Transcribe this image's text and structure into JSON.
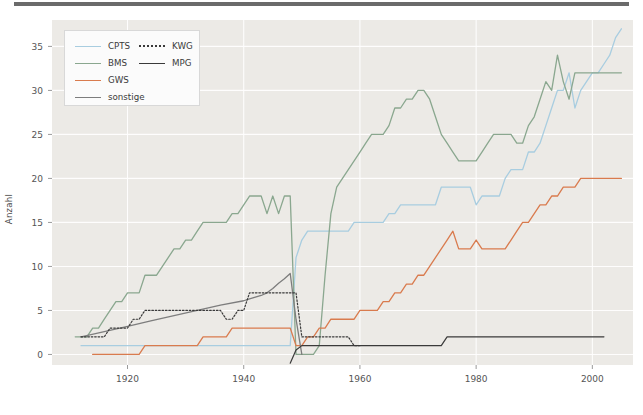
{
  "figure": {
    "background": "#ffffff",
    "plot_background": "#eceae6",
    "grid_color": "#ffffff",
    "top_rule_color": "#6b6b6b"
  },
  "chart_data": {
    "type": "line",
    "title": "",
    "xlabel": "",
    "ylabel": "Anzahl",
    "xlim": [
      1907,
      2007
    ],
    "ylim": [
      -1.2,
      38
    ],
    "xticks": [
      1920,
      1940,
      1960,
      1980,
      2000
    ],
    "yticks": [
      0,
      5,
      10,
      15,
      20,
      25,
      30,
      35
    ],
    "grid": true,
    "legend_position": "upper left",
    "legend_ncol": 2,
    "series": [
      {
        "name": "CPTS",
        "color": "#a8cde0",
        "style": "solid",
        "x": [
          1912,
          1913,
          1914,
          1915,
          1916,
          1917,
          1918,
          1919,
          1920,
          1921,
          1922,
          1923,
          1924,
          1925,
          1926,
          1927,
          1928,
          1929,
          1930,
          1931,
          1932,
          1933,
          1934,
          1935,
          1936,
          1937,
          1938,
          1939,
          1940,
          1941,
          1942,
          1943,
          1944,
          1945,
          1946,
          1947,
          1948,
          1949,
          1950,
          1951,
          1952,
          1953,
          1954,
          1955,
          1956,
          1957,
          1958,
          1959,
          1960,
          1961,
          1962,
          1963,
          1964,
          1965,
          1966,
          1967,
          1968,
          1969,
          1970,
          1971,
          1972,
          1973,
          1974,
          1975,
          1976,
          1977,
          1978,
          1979,
          1980,
          1981,
          1982,
          1983,
          1984,
          1985,
          1986,
          1987,
          1988,
          1989,
          1990,
          1991,
          1992,
          1993,
          1994,
          1995,
          1996,
          1997,
          1998,
          1999,
          2000,
          2001,
          2002,
          2003,
          2004,
          2005
        ],
        "y": [
          1,
          1,
          1,
          1,
          1,
          1,
          1,
          1,
          1,
          1,
          1,
          1,
          1,
          1,
          1,
          1,
          1,
          1,
          1,
          1,
          1,
          1,
          1,
          1,
          1,
          1,
          1,
          1,
          1,
          1,
          1,
          1,
          1,
          1,
          1,
          1,
          1,
          11,
          13,
          14,
          14,
          14,
          14,
          14,
          14,
          14,
          14,
          15,
          15,
          15,
          15,
          15,
          15,
          16,
          16,
          17,
          17,
          17,
          17,
          17,
          17,
          17,
          19,
          19,
          19,
          19,
          19,
          19,
          17,
          18,
          18,
          18,
          18,
          20,
          21,
          21,
          21,
          23,
          23,
          24,
          26,
          28,
          30,
          30,
          32,
          28,
          30,
          31,
          32,
          32,
          33,
          34,
          36,
          37
        ]
      },
      {
        "name": "BMS",
        "color": "#8aa78f",
        "style": "solid",
        "x": [
          1911,
          1912,
          1913,
          1914,
          1915,
          1916,
          1917,
          1918,
          1919,
          1920,
          1921,
          1922,
          1923,
          1924,
          1925,
          1926,
          1927,
          1928,
          1929,
          1930,
          1931,
          1932,
          1933,
          1934,
          1935,
          1936,
          1937,
          1938,
          1939,
          1940,
          1941,
          1942,
          1943,
          1944,
          1945,
          1946,
          1947,
          1948,
          1949,
          1950,
          1951,
          1952,
          1953,
          1954,
          1955,
          1956,
          1957,
          1958,
          1959,
          1960,
          1961,
          1962,
          1963,
          1964,
          1965,
          1966,
          1967,
          1968,
          1969,
          1970,
          1971,
          1972,
          1973,
          1974,
          1975,
          1976,
          1977,
          1978,
          1979,
          1980,
          1981,
          1982,
          1983,
          1984,
          1985,
          1986,
          1987,
          1988,
          1989,
          1990,
          1991,
          1992,
          1993,
          1994,
          1995,
          1996,
          1997,
          1998,
          1999,
          2000,
          2001,
          2002,
          2003,
          2004,
          2005
        ],
        "y": [
          2,
          2,
          2,
          3,
          3,
          4,
          5,
          6,
          6,
          7,
          7,
          7,
          9,
          9,
          9,
          10,
          11,
          12,
          12,
          13,
          13,
          14,
          15,
          15,
          15,
          15,
          15,
          16,
          16,
          17,
          18,
          18,
          18,
          16,
          18,
          16,
          18,
          18,
          0,
          0,
          0,
          0,
          1,
          9,
          16,
          19,
          20,
          21,
          22,
          23,
          24,
          25,
          25,
          25,
          26,
          28,
          28,
          29,
          29,
          30,
          30,
          29,
          27,
          25,
          24,
          23,
          22,
          22,
          22,
          22,
          23,
          24,
          25,
          25,
          25,
          25,
          24,
          24,
          26,
          27,
          29,
          31,
          30,
          34,
          31,
          29,
          32,
          32,
          32,
          32,
          32,
          32,
          32,
          32,
          32
        ]
      },
      {
        "name": "GWS",
        "color": "#d97b4e",
        "style": "solid",
        "x": [
          1914,
          1915,
          1916,
          1917,
          1918,
          1919,
          1920,
          1921,
          1922,
          1923,
          1924,
          1925,
          1926,
          1927,
          1928,
          1929,
          1930,
          1931,
          1932,
          1933,
          1934,
          1935,
          1936,
          1937,
          1938,
          1939,
          1940,
          1941,
          1942,
          1943,
          1944,
          1945,
          1946,
          1947,
          1948,
          1949,
          1950,
          1951,
          1952,
          1953,
          1954,
          1955,
          1956,
          1957,
          1958,
          1959,
          1960,
          1961,
          1962,
          1963,
          1964,
          1965,
          1966,
          1967,
          1968,
          1969,
          1970,
          1971,
          1972,
          1973,
          1974,
          1975,
          1976,
          1977,
          1978,
          1979,
          1980,
          1981,
          1982,
          1983,
          1984,
          1985,
          1986,
          1987,
          1988,
          1989,
          1990,
          1991,
          1992,
          1993,
          1994,
          1995,
          1996,
          1997,
          1998,
          1999,
          2000,
          2001,
          2002,
          2003,
          2004,
          2005
        ],
        "y": [
          0,
          0,
          0,
          0,
          0,
          0,
          0,
          0,
          0,
          1,
          1,
          1,
          1,
          1,
          1,
          1,
          1,
          1,
          1,
          2,
          2,
          2,
          2,
          2,
          3,
          3,
          3,
          3,
          3,
          3,
          3,
          3,
          3,
          3,
          3,
          1,
          1,
          2,
          2,
          3,
          3,
          4,
          4,
          4,
          4,
          4,
          5,
          5,
          5,
          5,
          6,
          6,
          7,
          7,
          8,
          8,
          9,
          9,
          10,
          11,
          12,
          13,
          14,
          12,
          12,
          12,
          13,
          12,
          12,
          12,
          12,
          12,
          13,
          14,
          15,
          15,
          16,
          17,
          17,
          18,
          18,
          19,
          19,
          19,
          20,
          20,
          20,
          20,
          20,
          20,
          20,
          20
        ]
      },
      {
        "name": "sonstige",
        "color": "#7d7d7d",
        "style": "solid",
        "x": [
          1912,
          1916,
          1920,
          1924,
          1928,
          1932,
          1936,
          1940,
          1941,
          1942,
          1943,
          1944,
          1945,
          1946,
          1947,
          1948,
          1949,
          1950
        ],
        "y": [
          2,
          2.6,
          3.2,
          3.8,
          4.4,
          5,
          5.6,
          6.1,
          6.3,
          6.5,
          6.7,
          7,
          7.5,
          8.1,
          8.6,
          9.2,
          4,
          0
        ]
      },
      {
        "name": "KWG",
        "color": "#3a3a3a",
        "style": "dotted",
        "x": [
          1912,
          1913,
          1914,
          1915,
          1916,
          1917,
          1918,
          1919,
          1920,
          1921,
          1922,
          1923,
          1924,
          1925,
          1926,
          1927,
          1928,
          1929,
          1930,
          1931,
          1932,
          1933,
          1934,
          1935,
          1936,
          1937,
          1938,
          1939,
          1940,
          1941,
          1942,
          1943,
          1944,
          1945,
          1946,
          1947,
          1948,
          1949,
          1950,
          1951,
          1952,
          1953,
          1954,
          1955,
          1956,
          1957,
          1958,
          1959,
          1960
        ],
        "y": [
          2,
          2,
          2,
          2,
          2,
          3,
          3,
          3,
          3,
          4,
          4,
          5,
          5,
          5,
          5,
          5,
          5,
          5,
          5,
          5,
          5,
          5,
          5,
          5,
          5,
          4,
          4,
          5,
          5,
          7,
          7,
          7,
          7,
          7,
          7,
          7,
          7,
          7,
          2,
          2,
          2,
          2,
          2,
          2,
          2,
          2,
          2,
          1,
          1
        ]
      },
      {
        "name": "MPG",
        "color": "#3a3a3a",
        "style": "solid",
        "x": [
          1948,
          1949,
          1950,
          1951,
          1952,
          1953,
          1954,
          1955,
          1956,
          1957,
          1958,
          1959,
          1960,
          1961,
          1962,
          1963,
          1964,
          1965,
          1966,
          1967,
          1968,
          1969,
          1970,
          1971,
          1972,
          1973,
          1974,
          1975,
          1976,
          1977,
          1978,
          1979,
          1980,
          1981,
          1982,
          1983,
          1984,
          1985,
          1986,
          1987,
          1988,
          1989,
          1990,
          1991,
          1992,
          1993,
          1994,
          1995,
          1996,
          1997,
          1998,
          1999,
          2000,
          2001,
          2002
        ],
        "y": [
          -1,
          0.5,
          1,
          1,
          1,
          1,
          1,
          1,
          1,
          1,
          1,
          1,
          1,
          1,
          1,
          1,
          1,
          1,
          1,
          1,
          1,
          1,
          1,
          1,
          1,
          1,
          1,
          2,
          2,
          2,
          2,
          2,
          2,
          2,
          2,
          2,
          2,
          2,
          2,
          2,
          2,
          2,
          2,
          2,
          2,
          2,
          2,
          2,
          2,
          2,
          2,
          2,
          2,
          2,
          2
        ]
      }
    ]
  },
  "legend": {
    "items": [
      {
        "label": "CPTS",
        "color": "#a8cde0",
        "style": "solid"
      },
      {
        "label": "BMS",
        "color": "#8aa78f",
        "style": "solid"
      },
      {
        "label": "GWS",
        "color": "#d97b4e",
        "style": "solid"
      },
      {
        "label": "sonstige",
        "color": "#7d7d7d",
        "style": "solid"
      },
      {
        "label": "KWG",
        "color": "#3a3a3a",
        "style": "dotted"
      },
      {
        "label": "MPG",
        "color": "#3a3a3a",
        "style": "solid"
      }
    ]
  },
  "axes": {
    "ylabel": "Anzahl",
    "ytick_labels": [
      "0",
      "5",
      "10",
      "15",
      "20",
      "25",
      "30",
      "35"
    ],
    "xtick_labels": [
      "1920",
      "1940",
      "1960",
      "1980",
      "2000"
    ]
  }
}
